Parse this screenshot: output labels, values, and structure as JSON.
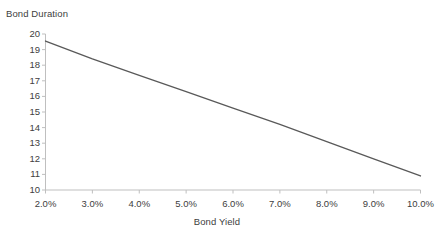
{
  "chart_data": {
    "type": "line",
    "title": "",
    "xlabel": "Bond Yield",
    "ylabel": "Bond Duration",
    "xlim": [
      2.0,
      10.0
    ],
    "ylim": [
      10,
      20
    ],
    "grid": false,
    "legend": false,
    "line_color": "#595959",
    "axis_color": "#bfbfbf",
    "x_tick_labels": [
      "2.0%",
      "3.0%",
      "4.0%",
      "5.0%",
      "6.0%",
      "7.0%",
      "8.0%",
      "9.0%",
      "10.0%"
    ],
    "y_tick_labels": [
      "20",
      "19",
      "18",
      "17",
      "16",
      "15",
      "14",
      "13",
      "12",
      "11",
      "10"
    ],
    "x": [
      2.0,
      3.0,
      4.0,
      5.0,
      6.0,
      7.0,
      8.0,
      9.0,
      10.0
    ],
    "values": [
      19.55,
      18.4,
      17.35,
      16.3,
      15.25,
      14.2,
      13.1,
      12.0,
      10.9
    ],
    "series": [
      {
        "name": "Bond Duration",
        "values": [
          19.55,
          18.4,
          17.35,
          16.3,
          15.25,
          14.2,
          13.1,
          12.0,
          10.9
        ]
      }
    ]
  }
}
